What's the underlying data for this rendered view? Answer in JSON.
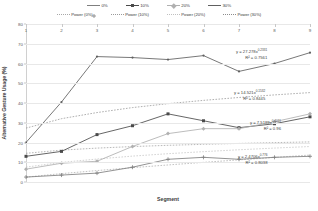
{
  "legend": {
    "series_row": [
      {
        "label": "0%",
        "color": "#7f7f7f",
        "marker": "plus"
      },
      {
        "label": "10%",
        "color": "#4a4a4a",
        "marker": "square"
      },
      {
        "label": "20%",
        "color": "#b0b0b0",
        "marker": "diamond"
      },
      {
        "label": "30%",
        "color": "#606060",
        "marker": "none"
      }
    ],
    "trend_row": [
      {
        "label": "Power (0%)",
        "color": "#a8a8a8"
      },
      {
        "label": "Power (10%)",
        "color": "#9a9a9a"
      },
      {
        "label": "Power (20%)",
        "color": "#c0c0c0"
      },
      {
        "label": "Power (30%)",
        "color": "#8c8c8c"
      }
    ]
  },
  "annotations": [
    {
      "name": "eq-30",
      "eq_a": "y = 27.278x",
      "eq_exp": "0.2331",
      "r2": "R² = 0.7561",
      "left": 236,
      "top": 48
    },
    {
      "name": "eq-10",
      "eq_a": "y = 14.521x",
      "eq_exp": "0.1532",
      "r2": "R² = 0.8445",
      "left": 234,
      "top": 89
    },
    {
      "name": "eq-20",
      "eq_a": "y = 7.5189x",
      "eq_exp": "0.4011",
      "r2": "R² = 0.96",
      "left": 250,
      "top": 119
    },
    {
      "name": "eq-0",
      "eq_a": "y = 2.4706x",
      "eq_exp": "0.776",
      "r2": "R² = 0.8038",
      "left": 238,
      "top": 153
    }
  ],
  "chart_data": {
    "type": "line",
    "title": "",
    "xlabel": "Segment",
    "ylabel": "Alternative Gesture Usage (%)",
    "x": [
      1,
      2,
      3,
      4,
      5,
      6,
      7,
      8,
      9
    ],
    "xlim": [
      1,
      9
    ],
    "ylim": [
      0,
      80
    ],
    "yticks": [
      0,
      10,
      20,
      30,
      40,
      50,
      60,
      70,
      80
    ],
    "xticks": [
      1,
      2,
      3,
      4,
      5,
      6,
      7,
      8,
      9
    ],
    "grid": true,
    "legend_position": "top",
    "series": [
      {
        "name": "0%",
        "color": "#7f7f7f",
        "marker": "plus",
        "values": [
          2.5,
          3.5,
          4.5,
          7.5,
          11.5,
          12.5,
          11.5,
          12.5,
          13.0
        ]
      },
      {
        "name": "10%",
        "color": "#4a4a4a",
        "marker": "square",
        "values": [
          13.0,
          15.5,
          24.0,
          28.5,
          34.5,
          31.0,
          27.5,
          29.5,
          33.0
        ]
      },
      {
        "name": "20%",
        "color": "#b0b0b0",
        "marker": "diamond",
        "values": [
          6.5,
          9.5,
          10.5,
          18.0,
          24.5,
          27.0,
          27.0,
          30.5,
          34.5
        ]
      },
      {
        "name": "30%",
        "color": "#606060",
        "marker": "none",
        "values": [
          20.0,
          40.5,
          63.5,
          63.0,
          62.0,
          64.0,
          56.0,
          60.0,
          65.5
        ]
      }
    ],
    "trendlines": [
      {
        "name": "Power (0%)",
        "color": "#a8a8a8",
        "equation": "y = 2.4706x^0.776",
        "r2": 0.8038,
        "values": [
          2.47,
          4.24,
          5.79,
          7.25,
          8.63,
          9.94,
          11.21,
          12.44,
          13.64
        ]
      },
      {
        "name": "Power (10%)",
        "color": "#9a9a9a",
        "equation": "y = 14.521x^0.1532",
        "r2": 0.8445,
        "values": [
          14.52,
          16.14,
          17.16,
          17.94,
          18.57,
          19.08,
          19.53,
          19.94,
          20.3
        ]
      },
      {
        "name": "Power (20%)",
        "color": "#c0c0c0",
        "equation": "y = 7.5189x^0.4011",
        "r2": 0.96,
        "values": [
          7.52,
          9.93,
          11.63,
          13.11,
          14.33,
          15.37,
          16.32,
          17.18,
          17.96
        ]
      },
      {
        "name": "Power (30%)",
        "color": "#8c8c8c",
        "equation": "y = 27.278x^0.2331",
        "r2": 0.7561,
        "values": [
          27.28,
          32.06,
          35.16,
          37.68,
          39.66,
          41.33,
          42.8,
          44.1,
          45.27
        ]
      }
    ]
  }
}
